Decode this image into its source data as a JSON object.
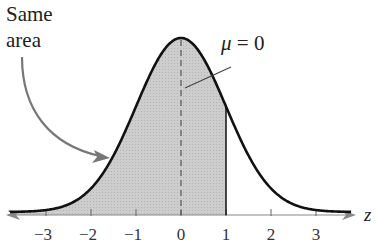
{
  "chart_data": {
    "type": "area",
    "title": "",
    "xlabel": "z",
    "ylabel": "",
    "xlim": [
      -3.8,
      3.8
    ],
    "ticks": [
      -3,
      -2,
      -1,
      0,
      1,
      2,
      3
    ],
    "tick_labels": [
      "−3",
      "−2",
      "−1",
      "0",
      "1",
      "2",
      "3"
    ],
    "mean": 0,
    "std": 1,
    "shaded_region": {
      "from": "-inf",
      "to": 1
    },
    "annotations": [
      {
        "text": "μ = 0",
        "points_to": "mean line at z = 0"
      },
      {
        "text": "Same area",
        "points_to": "shaded region left of curve"
      }
    ],
    "colors": {
      "curve": "#111111",
      "shade": "#c8c8c8",
      "arrow": "#777777",
      "axis": "#888888"
    },
    "grid": false
  },
  "labels": {
    "same_area_line1": "Same",
    "same_area_line2": "area",
    "mu_symbol": "μ",
    "mu_eq": " = 0",
    "axis_var": "z"
  }
}
